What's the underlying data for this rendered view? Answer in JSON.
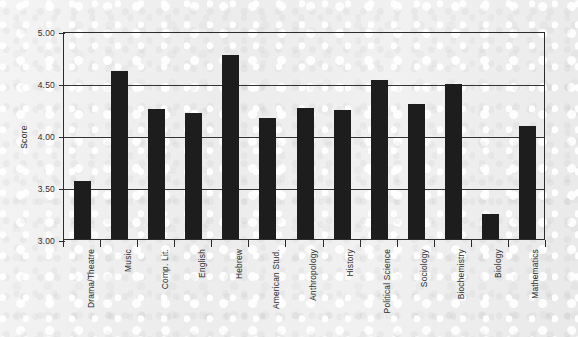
{
  "chart_data": {
    "type": "bar",
    "title": "",
    "xlabel": "",
    "ylabel": "Score",
    "ylim": [
      3.0,
      5.0
    ],
    "ytick_step": 0.5,
    "ytick_labels": [
      "5.00",
      "4.50",
      "4.00",
      "3.50",
      "3.00"
    ],
    "ytick_values": [
      5.0,
      4.5,
      4.0,
      3.5,
      3.0
    ],
    "grid": "horizontal",
    "legend": "none",
    "bar_color": "#1d1d1d",
    "categories": [
      "Drama/Theatre",
      "Music",
      "Comp. Lit.",
      "English",
      "Hebrew",
      "American Stud.",
      "Anthropology",
      "History",
      "Political Science",
      "Sociology",
      "Biochemistry",
      "Biology",
      "Mathematics"
    ],
    "values": [
      3.56,
      4.62,
      4.25,
      4.21,
      4.77,
      4.16,
      4.26,
      4.24,
      4.53,
      4.3,
      4.49,
      3.24,
      4.09
    ]
  }
}
